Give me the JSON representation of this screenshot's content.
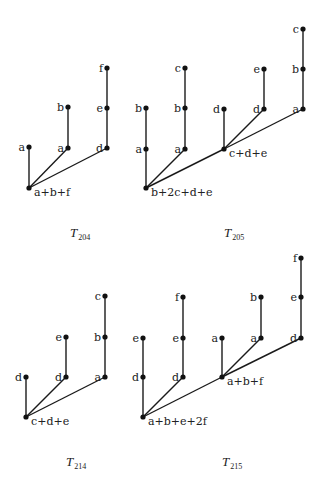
{
  "trees": [
    {
      "caption_main": "T",
      "caption_sub": "204",
      "caption_pos": [
        70,
        237
      ],
      "nodes": [
        {
          "x": 29,
          "y": 188,
          "label": "a+b+f",
          "side": "right-below"
        },
        {
          "x": 29,
          "y": 147,
          "label": "a",
          "side": "left"
        },
        {
          "x": 68,
          "y": 148,
          "label": "a",
          "side": "left"
        },
        {
          "x": 68,
          "y": 107,
          "label": "b",
          "side": "left"
        },
        {
          "x": 107,
          "y": 148,
          "label": "d",
          "side": "left"
        },
        {
          "x": 107,
          "y": 108,
          "label": "e",
          "side": "left"
        },
        {
          "x": 107,
          "y": 68,
          "label": "f",
          "side": "left"
        }
      ],
      "edges": [
        [
          0,
          1
        ],
        [
          0,
          2
        ],
        [
          2,
          3
        ],
        [
          0,
          4
        ],
        [
          4,
          5
        ],
        [
          5,
          6
        ]
      ]
    },
    {
      "caption_main": "T",
      "caption_sub": "205",
      "caption_pos": [
        224,
        237
      ],
      "nodes": [
        {
          "x": 146,
          "y": 188,
          "label": "b+2c+d+e",
          "side": "right-below"
        },
        {
          "x": 146,
          "y": 149,
          "label": "a",
          "side": "left"
        },
        {
          "x": 146,
          "y": 108,
          "label": "b",
          "side": "left"
        },
        {
          "x": 185,
          "y": 149,
          "label": "a",
          "side": "left"
        },
        {
          "x": 185,
          "y": 108,
          "label": "b",
          "side": "left"
        },
        {
          "x": 185,
          "y": 68,
          "label": "c",
          "side": "left"
        },
        {
          "x": 224,
          "y": 149,
          "label": "c+d+e",
          "side": "right-below"
        },
        {
          "x": 224,
          "y": 109,
          "label": "d",
          "side": "left"
        },
        {
          "x": 264,
          "y": 109,
          "label": "d",
          "side": "left"
        },
        {
          "x": 264,
          "y": 69,
          "label": "e",
          "side": "left"
        },
        {
          "x": 303,
          "y": 109,
          "label": "a",
          "side": "left"
        },
        {
          "x": 303,
          "y": 69,
          "label": "b",
          "side": "left"
        },
        {
          "x": 303,
          "y": 29,
          "label": "c",
          "side": "left"
        }
      ],
      "edges": [
        [
          0,
          1
        ],
        [
          1,
          2
        ],
        [
          0,
          3
        ],
        [
          3,
          4
        ],
        [
          4,
          5
        ],
        [
          0,
          6
        ],
        [
          6,
          7
        ],
        [
          6,
          8
        ],
        [
          8,
          9
        ],
        [
          6,
          10
        ],
        [
          10,
          11
        ],
        [
          11,
          12
        ]
      ]
    },
    {
      "caption_main": "T",
      "caption_sub": "214",
      "caption_pos": [
        66,
        466
      ],
      "nodes": [
        {
          "x": 26,
          "y": 417,
          "label": "c+d+e",
          "side": "right-below"
        },
        {
          "x": 26,
          "y": 377,
          "label": "d",
          "side": "left"
        },
        {
          "x": 66,
          "y": 377,
          "label": "d",
          "side": "left"
        },
        {
          "x": 66,
          "y": 337,
          "label": "e",
          "side": "left"
        },
        {
          "x": 105,
          "y": 377,
          "label": "a",
          "side": "left"
        },
        {
          "x": 105,
          "y": 337,
          "label": "b",
          "side": "left"
        },
        {
          "x": 105,
          "y": 296,
          "label": "c",
          "side": "left"
        }
      ],
      "edges": [
        [
          0,
          1
        ],
        [
          0,
          2
        ],
        [
          2,
          3
        ],
        [
          0,
          4
        ],
        [
          4,
          5
        ],
        [
          5,
          6
        ]
      ]
    },
    {
      "caption_main": "T",
      "caption_sub": "215",
      "caption_pos": [
        222,
        466
      ],
      "nodes": [
        {
          "x": 143,
          "y": 417,
          "label": "a+b+e+2f",
          "side": "right-below"
        },
        {
          "x": 143,
          "y": 377,
          "label": "d",
          "side": "left"
        },
        {
          "x": 143,
          "y": 338,
          "label": "e",
          "side": "left"
        },
        {
          "x": 183,
          "y": 377,
          "label": "d",
          "side": "left"
        },
        {
          "x": 183,
          "y": 338,
          "label": "e",
          "side": "left"
        },
        {
          "x": 183,
          "y": 297,
          "label": "f",
          "side": "left"
        },
        {
          "x": 222,
          "y": 377,
          "label": "a+b+f",
          "side": "right-below"
        },
        {
          "x": 222,
          "y": 338,
          "label": "a",
          "side": "left"
        },
        {
          "x": 261,
          "y": 338,
          "label": "a",
          "side": "left"
        },
        {
          "x": 261,
          "y": 297,
          "label": "b",
          "side": "left"
        },
        {
          "x": 301,
          "y": 338,
          "label": "d",
          "side": "left"
        },
        {
          "x": 301,
          "y": 297,
          "label": "e",
          "side": "left"
        },
        {
          "x": 301,
          "y": 258,
          "label": "f",
          "side": "left"
        }
      ],
      "edges": [
        [
          0,
          1
        ],
        [
          1,
          2
        ],
        [
          0,
          3
        ],
        [
          3,
          4
        ],
        [
          4,
          5
        ],
        [
          0,
          6
        ],
        [
          6,
          7
        ],
        [
          6,
          8
        ],
        [
          8,
          9
        ],
        [
          6,
          10
        ],
        [
          10,
          11
        ],
        [
          11,
          12
        ]
      ]
    }
  ]
}
